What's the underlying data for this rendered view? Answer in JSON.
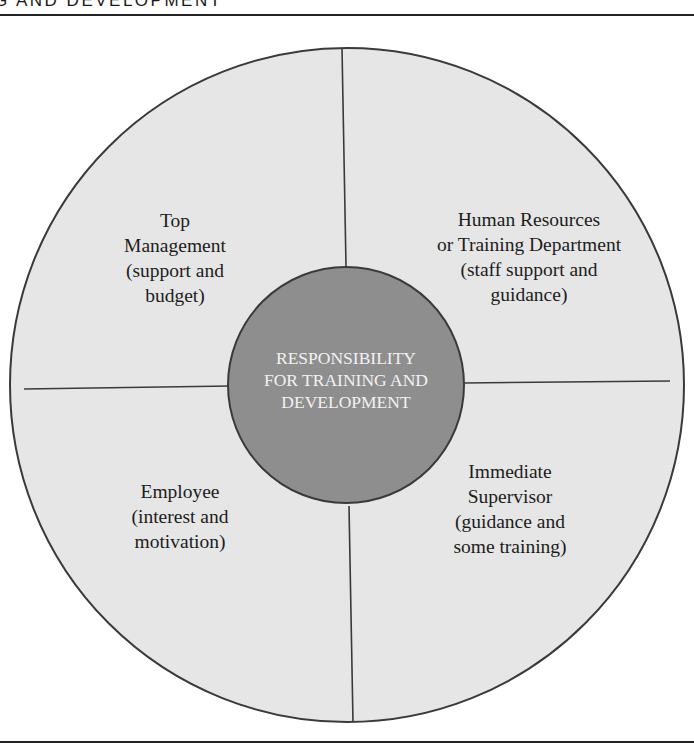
{
  "header": {
    "partial_title": "G AND DEVELOPMENT"
  },
  "diagram": {
    "center": {
      "lines": [
        "RESPONSIBILITY",
        "FOR TRAINING AND",
        "DEVELOPMENT"
      ]
    },
    "quadrants": [
      {
        "id": "top-left",
        "lines": [
          "Top",
          "Management",
          "(support and",
          "budget)"
        ]
      },
      {
        "id": "top-right",
        "lines": [
          "Human Resources",
          "or Training Department",
          "(staff support and",
          "guidance)"
        ]
      },
      {
        "id": "bottom-left",
        "lines": [
          "Employee",
          "(interest and",
          "motivation)"
        ]
      },
      {
        "id": "bottom-right",
        "lines": [
          "Immediate",
          "Supervisor",
          "(guidance and",
          "some training)"
        ]
      }
    ],
    "colors": {
      "outer_fill": "#e6e6e6",
      "inner_fill": "#8e8e8e",
      "stroke": "#3a3a3a",
      "center_text": "#f2f2f2",
      "label_text": "#1c1c1c"
    }
  }
}
